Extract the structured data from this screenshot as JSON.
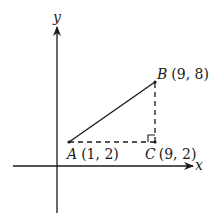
{
  "diagram": {
    "type": "coordinate-geometry",
    "axes": {
      "x_label": "x",
      "y_label": "y"
    },
    "points": [
      {
        "name": "A",
        "coords": "(1, 2)",
        "x": 1,
        "y": 2
      },
      {
        "name": "B",
        "coords": "(9, 8)",
        "x": 9,
        "y": 8
      },
      {
        "name": "C",
        "coords": "(9, 2)",
        "x": 9,
        "y": 2
      }
    ],
    "segments": [
      {
        "from": "A",
        "to": "B",
        "style": "solid"
      },
      {
        "from": "A",
        "to": "C",
        "style": "dashed"
      },
      {
        "from": "C",
        "to": "B",
        "style": "dashed"
      }
    ],
    "right_angle_at": "C",
    "colors": {
      "ink": "#1a1a1a",
      "background": "#ffffff"
    }
  }
}
